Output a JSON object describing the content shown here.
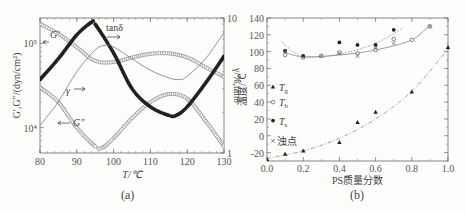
{
  "figure": {
    "caption_a": "(a)",
    "caption_b": "(b)"
  },
  "chart_data": [
    {
      "type": "line",
      "title": "",
      "panel": "(a)",
      "xlabel": "T/℃",
      "ylabel_left": "G′,G″/(dyn/cm²)",
      "ylabel_right": "γ/%,tanδ",
      "xlim": [
        80,
        130
      ],
      "xticks": [
        80,
        90,
        100,
        110,
        120,
        130
      ],
      "ylim_left": [
        5000,
        200000
      ],
      "yticks_left": [
        "10⁴",
        "10⁵"
      ],
      "yscale_left": "log",
      "ylim_right": [
        1,
        10
      ],
      "yticks_right": [
        "1",
        "10"
      ],
      "yscale_right": "log",
      "annotations": [
        "G′ ←",
        "G″ ←",
        "γ →",
        "tanδ →"
      ],
      "series": [
        {
          "name": "G′",
          "axis": "left",
          "marker": "open-circle",
          "x": [
            80,
            85,
            90,
            95,
            100,
            105,
            110,
            115,
            120,
            125,
            130
          ],
          "y": [
            170000,
            130000,
            90000,
            62000,
            60000,
            68000,
            75000,
            76000,
            68000,
            52000,
            40000
          ]
        },
        {
          "name": "G″",
          "axis": "left",
          "marker": "open-circle",
          "x": [
            80,
            85,
            90,
            95,
            97,
            100,
            105,
            110,
            115,
            120,
            125,
            130
          ],
          "y": [
            30000,
            20000,
            10000,
            6000,
            5800,
            7500,
            13000,
            20000,
            25000,
            22000,
            12000,
            6000
          ]
        },
        {
          "name": "tanδ",
          "axis": "right",
          "marker": "filled-circle",
          "x": [
            80,
            85,
            90,
            94,
            95,
            100,
            105,
            110,
            115,
            117,
            120,
            125,
            130
          ],
          "y": [
            3.5,
            5.0,
            7.5,
            9.3,
            9.0,
            5.5,
            3.0,
            2.2,
            1.9,
            1.9,
            2.2,
            3.3,
            5.2
          ]
        },
        {
          "name": "γ",
          "axis": "right",
          "marker": "line",
          "x": [
            80,
            85,
            90,
            95,
            98,
            100,
            105,
            110,
            115,
            118,
            120,
            125,
            130
          ],
          "y": [
            1.6,
            2.4,
            4.0,
            5.8,
            6.3,
            6.1,
            5.0,
            4.1,
            3.6,
            3.5,
            3.7,
            5.0,
            7.8
          ]
        }
      ]
    },
    {
      "type": "scatter",
      "title": "",
      "panel": "(b)",
      "xlabel": "PS质量分数",
      "ylabel": "温度/℃",
      "xlim": [
        0.0,
        1.0
      ],
      "xticks": [
        "0.0",
        "0.2",
        "0.4",
        "0.6",
        "0.8",
        "1.0"
      ],
      "ylim": [
        -30,
        140
      ],
      "yticks": [
        "-20",
        "0",
        "20",
        "40",
        "60",
        "80",
        "100",
        "120",
        "140"
      ],
      "legend": [
        "Tg",
        "Tb",
        "Ts",
        "浊点"
      ],
      "legend_position": "left",
      "series": [
        {
          "name": "Tg",
          "marker": "filled-triangle",
          "x": [
            0.0,
            0.1,
            0.2,
            0.4,
            0.5,
            0.6,
            0.8,
            1.0
          ],
          "y": [
            -28,
            -22,
            -18,
            -8,
            16,
            28,
            52,
            105
          ]
        },
        {
          "name": "Tb",
          "marker": "open-circle",
          "x": [
            0.1,
            0.2,
            0.3,
            0.4,
            0.5,
            0.6,
            0.7,
            0.8,
            0.9
          ],
          "y": [
            96,
            93,
            95,
            99,
            98,
            102,
            115,
            114,
            130
          ]
        },
        {
          "name": "Ts",
          "marker": "filled-circle",
          "x": [
            0.1,
            0.2,
            0.4,
            0.5,
            0.6,
            0.7
          ],
          "y": [
            101,
            95,
            111,
            108,
            108,
            126
          ]
        },
        {
          "name": "浊点",
          "marker": "cross",
          "x": [
            0.1,
            0.2,
            0.3,
            0.4,
            0.5,
            0.6,
            0.7,
            0.9
          ],
          "y": [
            101,
            94,
            95,
            98,
            95,
            104,
            110,
            130
          ]
        }
      ],
      "fit_curves": [
        {
          "name": "Tg fit",
          "style": "dash-dot",
          "x": [
            0.0,
            0.2,
            0.4,
            0.6,
            0.8,
            1.0
          ],
          "y": [
            -27,
            -18,
            -3,
            20,
            53,
            103
          ]
        },
        {
          "name": "Tb fit",
          "style": "solid",
          "x": [
            0.1,
            0.2,
            0.4,
            0.6,
            0.8,
            0.9
          ],
          "y": [
            99,
            94,
            96,
            102,
            114,
            132
          ]
        },
        {
          "name": "Ts fit",
          "style": "dotted",
          "x": [
            0.08,
            0.2,
            0.4,
            0.6,
            0.75
          ],
          "y": [
            112,
            94,
            97,
            110,
            128
          ]
        }
      ]
    }
  ]
}
